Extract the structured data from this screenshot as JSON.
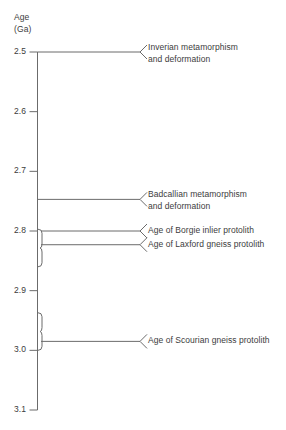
{
  "axis": {
    "title_line1": "Age",
    "title_line2": "(Ga)",
    "unit": "Ga",
    "min": 2.5,
    "max": 3.1,
    "ticks": [
      "2.5",
      "2.6",
      "2.7",
      "2.8",
      "2.9",
      "3.0",
      "3.1"
    ],
    "tick_values": [
      2.5,
      2.6,
      2.7,
      2.8,
      2.9,
      3.0,
      3.1
    ],
    "direction": "older-downward",
    "line_color": "#6b6b6b",
    "text_color": "#3c3c3c"
  },
  "events": [
    {
      "id": "inverian",
      "line1": "Inverian metamorphism",
      "line2": "and deformation",
      "age": 2.5,
      "marker": "line"
    },
    {
      "id": "badcallian",
      "line1": "Badcallian metamorphism",
      "line2": "and deformation",
      "age": 2.747,
      "marker": "line"
    },
    {
      "id": "borgie",
      "line1": "Age of Borgie inlier protolith",
      "line2": "",
      "age": 2.8,
      "marker": "brace-top"
    },
    {
      "id": "laxford",
      "line1": "Age of Laxford gneiss protolith",
      "line2": "",
      "age": 2.823,
      "marker": "brace-bottom"
    },
    {
      "id": "scourian",
      "line1": "Age of Scourian gneiss protolith",
      "line2": "",
      "age": 2.985,
      "marker": "brace"
    }
  ],
  "braces": [
    {
      "id": "brace-upper",
      "from": 2.797,
      "to": 2.86
    },
    {
      "id": "brace-lower",
      "from": 2.937,
      "to": 3.0
    }
  ],
  "chart_data": {
    "type": "timeline",
    "title": "",
    "ylabel": "Age (Ga)",
    "ylim": [
      2.5,
      3.1
    ],
    "tick_labels": [
      "2.5",
      "2.6",
      "2.7",
      "2.8",
      "2.9",
      "3.0",
      "3.1"
    ],
    "annotations": [
      {
        "label": "Inverian metamorphism and deformation",
        "age": 2.5
      },
      {
        "label": "Badcallian metamorphism and deformation",
        "age": 2.747
      },
      {
        "label": "Age of Borgie inlier protolith",
        "age": 2.8
      },
      {
        "label": "Age of Laxford gneiss protolith",
        "age": 2.823
      },
      {
        "label": "Age of Scourian gneiss protolith",
        "age": 2.985
      }
    ],
    "grid": false,
    "legend": "none"
  }
}
